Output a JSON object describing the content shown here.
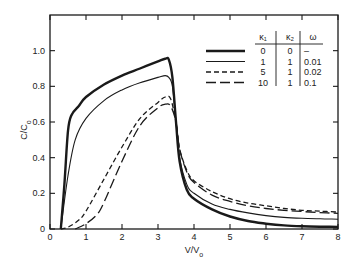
{
  "chart_data": {
    "type": "line",
    "title": "",
    "xlabel": "V/V₀",
    "ylabel": "C/C₀",
    "xlim": [
      0,
      8
    ],
    "ylim": [
      0,
      1.2
    ],
    "grid": false,
    "legend_position": "upper right (inside, table form)",
    "x_ticks": [
      "0",
      "1",
      "2",
      "3",
      "4",
      "5",
      "6",
      "7",
      "8"
    ],
    "y_ticks": [
      "0",
      "0.2",
      "0.4",
      "0.6",
      "0.8",
      "1.0"
    ],
    "legend": {
      "headers": [
        "κ₁",
        "κ₂",
        "ω"
      ],
      "rows": [
        {
          "style": "thick-solid",
          "k1": "0",
          "k2": "0",
          "omega": "–"
        },
        {
          "style": "thin-solid",
          "k1": "1",
          "k2": "1",
          "omega": "0.01"
        },
        {
          "style": "short-dash",
          "k1": "5",
          "k2": "1",
          "omega": "0.02"
        },
        {
          "style": "long-dash",
          "k1": "10",
          "k2": "1",
          "omega": "0.1"
        }
      ]
    },
    "series": [
      {
        "name": "κ1=0, κ2=0, ω=–",
        "style": "thick-solid",
        "x": [
          0.3,
          0.4,
          0.5,
          0.6,
          0.8,
          1.0,
          1.5,
          2.0,
          2.5,
          3.0,
          3.2,
          3.3,
          3.4,
          3.5,
          3.6,
          3.8,
          4.0,
          4.5,
          5.0,
          5.5,
          6.0,
          6.5,
          7.0,
          7.5,
          8.0
        ],
        "y": [
          0.0,
          0.25,
          0.55,
          0.64,
          0.69,
          0.74,
          0.81,
          0.86,
          0.9,
          0.94,
          0.955,
          0.95,
          0.85,
          0.6,
          0.38,
          0.22,
          0.17,
          0.11,
          0.07,
          0.045,
          0.03,
          0.02,
          0.015,
          0.013,
          0.012
        ]
      },
      {
        "name": "κ1=1, κ2=1, ω=0.01",
        "style": "thin-solid",
        "x": [
          0.3,
          0.5,
          0.7,
          1.0,
          1.5,
          2.0,
          2.5,
          3.0,
          3.2,
          3.3,
          3.4,
          3.5,
          3.6,
          3.8,
          4.0,
          4.5,
          5.0,
          5.5,
          6.0,
          6.5,
          7.0,
          7.5,
          8.0
        ],
        "y": [
          0.0,
          0.3,
          0.5,
          0.62,
          0.72,
          0.78,
          0.82,
          0.85,
          0.86,
          0.85,
          0.8,
          0.6,
          0.4,
          0.25,
          0.2,
          0.14,
          0.11,
          0.09,
          0.075,
          0.065,
          0.06,
          0.057,
          0.055
        ]
      },
      {
        "name": "κ1=5, κ2=1, ω=0.02",
        "style": "short-dash",
        "x": [
          0.3,
          0.5,
          0.8,
          1.0,
          1.5,
          2.0,
          2.5,
          3.0,
          3.2,
          3.35,
          3.5,
          3.6,
          3.8,
          4.0,
          4.5,
          5.0,
          5.5,
          6.0,
          6.5,
          7.0,
          7.5,
          8.0
        ],
        "y": [
          0.0,
          0.01,
          0.05,
          0.1,
          0.28,
          0.46,
          0.62,
          0.71,
          0.74,
          0.73,
          0.6,
          0.45,
          0.33,
          0.27,
          0.21,
          0.17,
          0.145,
          0.13,
          0.115,
          0.105,
          0.1,
          0.095
        ]
      },
      {
        "name": "κ1=10, κ2=1, ω=0.1",
        "style": "long-dash",
        "x": [
          0.7,
          1.0,
          1.3,
          1.5,
          2.0,
          2.5,
          3.0,
          3.2,
          3.35,
          3.5,
          3.6,
          3.8,
          4.0,
          4.5,
          5.0,
          5.5,
          6.0,
          6.5,
          7.0,
          7.5,
          8.0
        ],
        "y": [
          0.0,
          0.03,
          0.08,
          0.15,
          0.38,
          0.58,
          0.68,
          0.7,
          0.69,
          0.6,
          0.45,
          0.32,
          0.26,
          0.19,
          0.155,
          0.13,
          0.115,
          0.105,
          0.098,
          0.092,
          0.088
        ]
      }
    ]
  }
}
